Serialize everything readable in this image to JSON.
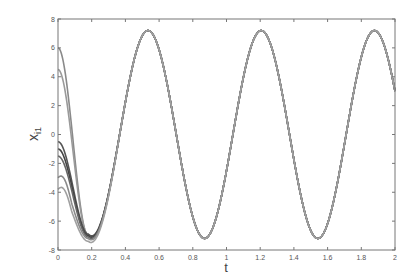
{
  "chart_data": {
    "type": "line",
    "title": "",
    "xlabel": "t",
    "ylabel": "x_i1",
    "ylabel_main": "x",
    "ylabel_sub": "i1",
    "xlim": [
      0,
      2
    ],
    "ylim": [
      -8,
      8
    ],
    "xticks": [
      0,
      0.2,
      0.4,
      0.6,
      0.8,
      1,
      1.2,
      1.4,
      1.6,
      1.8,
      2
    ],
    "xtick_labels": [
      "0",
      "0.2",
      "0.4",
      "0.6",
      "0.8",
      "1",
      "1.2",
      "1.4",
      "1.6",
      "1.8",
      "2"
    ],
    "yticks": [
      -8,
      -6,
      -4,
      -2,
      0,
      2,
      4,
      6,
      8
    ],
    "ytick_labels": [
      "-8",
      "-6",
      "-4",
      "-2",
      "0",
      "2",
      "4",
      "6",
      "8"
    ],
    "grid": false,
    "legend": null,
    "common_trajectory": {
      "description": "All trajectories converge to a sinusoid of amplitude ~7.2 and period ~0.67",
      "amplitude": 7.2,
      "period": 0.672,
      "peak_times": [
        0.534,
        1.206,
        1.878
      ],
      "trough_times": [
        0.87,
        1.542
      ],
      "value_at_t2": 4.0
    },
    "series": [
      {
        "name": "x_11",
        "initial_value": 6.0,
        "first_min": -7.0,
        "color": "#8a8a8a"
      },
      {
        "name": "x_21",
        "initial_value": 4.5,
        "first_min": -7.0,
        "color": "#9a9a9a"
      },
      {
        "name": "x_31",
        "initial_value": -0.5,
        "first_min": -6.9,
        "color": "#555555"
      },
      {
        "name": "x_41",
        "initial_value": -1.0,
        "first_min": -7.0,
        "color": "#444444"
      },
      {
        "name": "x_51",
        "initial_value": -1.5,
        "first_min": -7.1,
        "color": "#666666"
      },
      {
        "name": "x_61",
        "initial_value": -3.0,
        "first_min": -7.2,
        "color": "#8a8a8a"
      },
      {
        "name": "x_71",
        "initial_value": -3.8,
        "first_min": -7.4,
        "color": "#a0a0a0"
      }
    ],
    "first_min_time": 0.18
  }
}
